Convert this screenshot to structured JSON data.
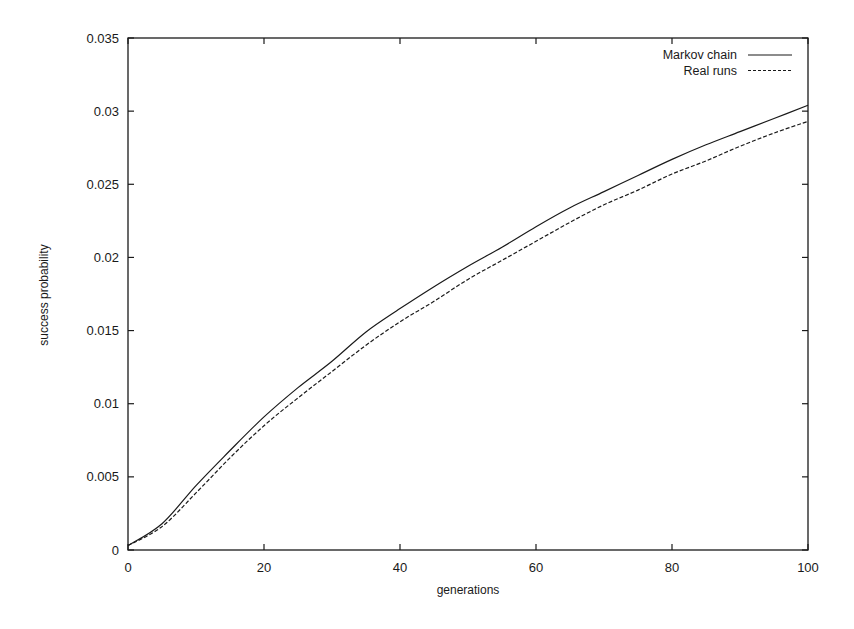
{
  "chart_data": {
    "type": "line",
    "title": "",
    "xlabel": "generations",
    "ylabel": "success probability",
    "xlim": [
      0,
      100
    ],
    "ylim": [
      0,
      0.035
    ],
    "xticks": [
      0,
      20,
      40,
      60,
      80,
      100
    ],
    "xtick_labels": [
      "0",
      "20",
      "40",
      "60",
      "80",
      "100"
    ],
    "yticks": [
      0,
      0.005,
      0.01,
      0.015,
      0.02,
      0.025,
      0.03,
      0.035
    ],
    "ytick_labels": [
      "0",
      "0.005",
      "0.01",
      "0.015",
      "0.02",
      "0.025",
      "0.03",
      "0.035"
    ],
    "grid": false,
    "legend_position": "top-right",
    "x": [
      0,
      5,
      10,
      15,
      20,
      25,
      30,
      35,
      40,
      45,
      50,
      55,
      60,
      65,
      70,
      75,
      80,
      85,
      90,
      95,
      100
    ],
    "series": [
      {
        "name": "Markov chain",
        "style": "solid",
        "values": [
          0.0003,
          0.0018,
          0.0044,
          0.0068,
          0.0091,
          0.0111,
          0.0129,
          0.0149,
          0.0165,
          0.018,
          0.0194,
          0.0207,
          0.0221,
          0.0234,
          0.0245,
          0.0256,
          0.0267,
          0.0277,
          0.0286,
          0.0295,
          0.0304
        ]
      },
      {
        "name": "Real runs",
        "style": "dashed",
        "values": [
          0.0003,
          0.0016,
          0.0039,
          0.0063,
          0.0085,
          0.0104,
          0.0122,
          0.014,
          0.0156,
          0.017,
          0.0185,
          0.0198,
          0.0211,
          0.0224,
          0.0236,
          0.0246,
          0.0257,
          0.0266,
          0.0276,
          0.0285,
          0.0293
        ]
      }
    ]
  },
  "colors": {
    "line": "#1a1a1a",
    "axis": "#1a1a1a",
    "background": "#ffffff"
  }
}
